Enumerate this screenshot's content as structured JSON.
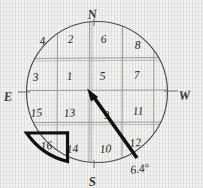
{
  "figure": {
    "background_color": "#f2f2f0",
    "ink_color": "#3a3a3a",
    "bold_ink_color": "#111111",
    "circle": {
      "center_x": 97,
      "center_y": 92,
      "radius": 71
    },
    "compass": {
      "north": "N",
      "south": "S",
      "east": "E",
      "west": "W",
      "north_pos": {
        "x": 92,
        "y": 14
      },
      "south_pos": {
        "x": 93,
        "y": 182
      },
      "east_pos": {
        "x": 9,
        "y": 97
      },
      "west_pos": {
        "x": 183,
        "y": 97
      }
    },
    "grid": {
      "rows": 4,
      "cols": 4,
      "x_lines": [
        57,
        89,
        122,
        154
      ],
      "y_lines": [
        58,
        90,
        122
      ],
      "cells": [
        {
          "label": "4",
          "x": 44,
          "y": 40
        },
        {
          "label": "2",
          "x": 72,
          "y": 38
        },
        {
          "label": "6",
          "x": 105,
          "y": 38
        },
        {
          "label": "8",
          "x": 138,
          "y": 44
        },
        {
          "label": "3",
          "x": 37,
          "y": 76
        },
        {
          "label": "1",
          "x": 70,
          "y": 75
        },
        {
          "label": "5",
          "x": 103,
          "y": 75
        },
        {
          "label": "7",
          "x": 137,
          "y": 74
        },
        {
          "label": "15",
          "x": 37,
          "y": 112
        },
        {
          "label": "13",
          "x": 70,
          "y": 112
        },
        {
          "label": "9",
          "x": 108,
          "y": 113
        },
        {
          "label": "11",
          "x": 138,
          "y": 110
        },
        {
          "label": "16",
          "x": 45,
          "y": 145
        },
        {
          "label": "14",
          "x": 72,
          "y": 148
        },
        {
          "label": "10",
          "x": 105,
          "y": 148
        },
        {
          "label": "12",
          "x": 134,
          "y": 142
        }
      ]
    },
    "arrow": {
      "name": "direction-arrow",
      "tail_x": 137,
      "tail_y": 158,
      "tip_x": 88,
      "tip_y": 90,
      "color": "#111111",
      "width": 3.6
    },
    "angle_annotation": {
      "label": "6.4°",
      "x": 132,
      "y": 170
    },
    "highlighted_cell": {
      "name": "cell-16-highlight",
      "label": "16",
      "color": "#111111",
      "stroke_width": 3.2
    }
  }
}
